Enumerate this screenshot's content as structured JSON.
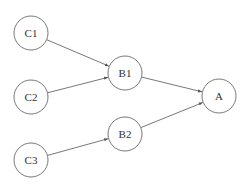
{
  "diagram": {
    "type": "directed-graph",
    "nodes": [
      {
        "id": "C1",
        "label": "C1",
        "x": 31,
        "y": 33
      },
      {
        "id": "C2",
        "label": "C2",
        "x": 31,
        "y": 97
      },
      {
        "id": "C3",
        "label": "C3",
        "x": 31,
        "y": 160
      },
      {
        "id": "B1",
        "label": "B1",
        "x": 125,
        "y": 73
      },
      {
        "id": "B2",
        "label": "B2",
        "x": 125,
        "y": 134
      },
      {
        "id": "A",
        "label": "A",
        "x": 219,
        "y": 96
      }
    ],
    "edges": [
      {
        "from": "C1",
        "to": "B1"
      },
      {
        "from": "C2",
        "to": "B1"
      },
      {
        "from": "C3",
        "to": "B2"
      },
      {
        "from": "B1",
        "to": "A"
      },
      {
        "from": "B2",
        "to": "A"
      }
    ],
    "node_radius": 17,
    "colors": {
      "stroke": "#555555",
      "text": "#333333",
      "background": "#ffffff"
    }
  }
}
